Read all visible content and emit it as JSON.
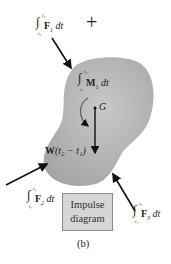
{
  "diagram": {
    "caption": "(b)",
    "box_label_line1": "Impulse",
    "box_label_line2": "diagram",
    "plus_sign": "+",
    "labels": {
      "F1": {
        "sym": "F",
        "sub": "1",
        "tail": " dt",
        "upper": "t₂",
        "lower": "t₁"
      },
      "M1": {
        "sym": "M",
        "sub": "1",
        "tail": " dt",
        "upper": "t₂",
        "lower": "t₁"
      },
      "F2": {
        "sym": "F",
        "sub": "2",
        "tail": " dt",
        "upper": "t₂",
        "lower": "t₁"
      },
      "F3": {
        "sym": "F",
        "sub": "3",
        "tail": " dt",
        "upper": "t₂",
        "lower": "t₁"
      },
      "G": "G",
      "W": "W",
      "W_tail": "(t₂ − t₁)"
    },
    "colors": {
      "body_fill": "#b5b5b5",
      "box_fill": "#d6d6d6",
      "arrow": "#111111"
    }
  }
}
